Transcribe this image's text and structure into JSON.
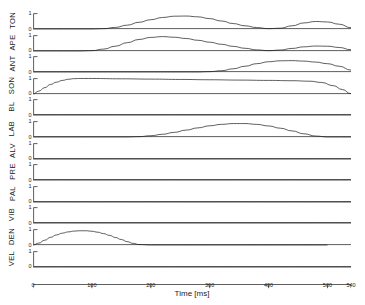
{
  "chart_data": {
    "type": "line",
    "title": "",
    "xlabel": "Time [ms]",
    "ylabel": "",
    "xlim": [
      0,
      540
    ],
    "ylim": [
      0,
      1
    ],
    "grid": false,
    "legend": "none",
    "xticks": [
      0,
      100,
      200,
      300,
      400,
      500,
      540
    ],
    "xticklabels": [
      "0",
      "100",
      "200",
      "300",
      "400",
      "500",
      "540"
    ],
    "yticks": [
      0,
      1
    ],
    "yticklabels": [
      "0",
      "1"
    ],
    "layout": "stacked subplots, one row per tract variable, shared x axis",
    "panels": [
      {
        "label": "TON",
        "x": [
          0,
          20,
          40,
          60,
          80,
          100,
          120,
          140,
          160,
          180,
          200,
          220,
          240,
          260,
          280,
          300,
          320,
          340,
          360,
          380,
          400,
          420,
          440,
          460,
          480,
          500,
          520,
          540
        ],
        "y": [
          0.0,
          0.0,
          0.0,
          0.0,
          0.0,
          0.0,
          0.02,
          0.1,
          0.24,
          0.42,
          0.58,
          0.72,
          0.8,
          0.81,
          0.76,
          0.65,
          0.5,
          0.34,
          0.2,
          0.09,
          0.02,
          0.05,
          0.2,
          0.38,
          0.47,
          0.44,
          0.3,
          0.08
        ]
      },
      {
        "label": "APE",
        "x": [
          0,
          20,
          40,
          60,
          80,
          100,
          120,
          140,
          160,
          180,
          200,
          220,
          240,
          260,
          280,
          300,
          320,
          340,
          360,
          380,
          400,
          420,
          440,
          460,
          480,
          500,
          520,
          540
        ],
        "y": [
          0.0,
          0.0,
          0.0,
          0.0,
          0.0,
          0.02,
          0.12,
          0.3,
          0.52,
          0.72,
          0.85,
          0.9,
          0.86,
          0.78,
          0.67,
          0.55,
          0.42,
          0.29,
          0.17,
          0.07,
          0.02,
          0.06,
          0.16,
          0.26,
          0.31,
          0.3,
          0.22,
          0.08
        ]
      },
      {
        "label": "ANT",
        "x": [
          0,
          40,
          80,
          120,
          160,
          200,
          240,
          280,
          300,
          320,
          340,
          360,
          380,
          400,
          420,
          440,
          460,
          480,
          500,
          520,
          540
        ],
        "y": [
          0.0,
          0.0,
          0.0,
          0.0,
          0.0,
          0.0,
          0.0,
          0.0,
          0.02,
          0.08,
          0.2,
          0.36,
          0.52,
          0.64,
          0.7,
          0.71,
          0.68,
          0.62,
          0.52,
          0.36,
          0.12
        ]
      },
      {
        "label": "SON",
        "x": [
          0,
          10,
          20,
          30,
          40,
          50,
          60,
          70,
          80,
          100,
          150,
          200,
          250,
          300,
          350,
          400,
          440,
          470,
          490,
          510,
          525,
          540
        ],
        "y": [
          0.0,
          0.18,
          0.4,
          0.6,
          0.74,
          0.85,
          0.92,
          0.96,
          0.97,
          0.97,
          0.95,
          0.93,
          0.91,
          0.89,
          0.87,
          0.85,
          0.83,
          0.8,
          0.72,
          0.52,
          0.28,
          0.02
        ]
      },
      {
        "label": "BL",
        "x": [
          0,
          100,
          200,
          300,
          400,
          500,
          540
        ],
        "y": [
          0.0,
          0.0,
          0.0,
          0.0,
          0.0,
          0.0,
          0.0
        ]
      },
      {
        "label": "LAB",
        "x": [
          0,
          40,
          80,
          120,
          160,
          180,
          200,
          220,
          240,
          260,
          280,
          300,
          320,
          340,
          360,
          380,
          400,
          420,
          440,
          460,
          480,
          500,
          540
        ],
        "y": [
          0.0,
          0.0,
          0.0,
          0.0,
          0.0,
          0.02,
          0.08,
          0.17,
          0.29,
          0.43,
          0.57,
          0.7,
          0.79,
          0.84,
          0.84,
          0.79,
          0.69,
          0.55,
          0.38,
          0.2,
          0.06,
          0.0,
          0.0
        ]
      },
      {
        "label": "ALV",
        "x": [
          0,
          100,
          200,
          300,
          400,
          500,
          540
        ],
        "y": [
          0.0,
          0.0,
          0.0,
          0.0,
          0.0,
          0.0,
          0.0
        ]
      },
      {
        "label": "PRE",
        "x": [
          0,
          100,
          200,
          300,
          400,
          500,
          540
        ],
        "y": [
          0.0,
          0.0,
          0.0,
          0.0,
          0.0,
          0.0,
          0.0
        ]
      },
      {
        "label": "PAL",
        "x": [
          0,
          100,
          200,
          300,
          400,
          500,
          540
        ],
        "y": [
          0.0,
          0.0,
          0.0,
          0.0,
          0.0,
          0.0,
          0.0
        ]
      },
      {
        "label": "VIB",
        "x": [
          0,
          100,
          200,
          300,
          400,
          500,
          540
        ],
        "y": [
          0.0,
          0.0,
          0.0,
          0.0,
          0.0,
          0.0,
          0.0
        ]
      },
      {
        "label": "DEN",
        "x": [
          0,
          10,
          20,
          30,
          40,
          50,
          60,
          70,
          80,
          90,
          100,
          110,
          120,
          130,
          140,
          150,
          160,
          170,
          180,
          200,
          300,
          400,
          500,
          540
        ],
        "y": [
          0.0,
          0.12,
          0.3,
          0.48,
          0.63,
          0.74,
          0.82,
          0.87,
          0.89,
          0.89,
          0.86,
          0.8,
          0.71,
          0.6,
          0.47,
          0.34,
          0.21,
          0.1,
          0.03,
          0.0,
          0.0,
          0.0,
          0.0
        ]
      },
      {
        "label": "VEL",
        "x": [
          0,
          100,
          200,
          300,
          400,
          500,
          540
        ],
        "y": [
          0.0,
          0.0,
          0.0,
          0.0,
          0.0,
          0.0,
          0.0
        ]
      }
    ]
  }
}
